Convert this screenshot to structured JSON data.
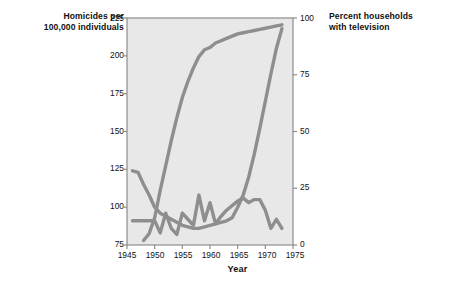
{
  "chart_data": {
    "type": "line",
    "title": "",
    "xlabel": "Year",
    "ylabel_left": "Homicides per\n100,000 individuals",
    "ylabel_right": "Percent households\nwith television",
    "xlim": [
      1945,
      1975
    ],
    "ylim_left": [
      75,
      225
    ],
    "ylim_right": [
      0,
      100
    ],
    "grid": false,
    "legend_position": "inline-annotations",
    "xticks": [
      "1945",
      "1950",
      "1955",
      "1960",
      "1965",
      "1970",
      "1975"
    ],
    "xtick_values": [
      1945,
      1950,
      1955,
      1960,
      1965,
      1970,
      1975
    ],
    "yticks_left": [
      "75",
      "100",
      "125",
      "150",
      "175",
      "200",
      "225"
    ],
    "ytick_left_values": [
      75,
      100,
      125,
      150,
      175,
      200,
      225
    ],
    "yticks_right": [
      "0",
      "25",
      "50",
      "75",
      "100"
    ],
    "ytick_right_values": [
      0,
      25,
      50,
      75,
      100
    ],
    "series": [
      {
        "name": "Television ownership, United States",
        "axis": "right",
        "label_text": "Television ownership,\nUnited States",
        "color": "#8e8e8e",
        "x": [
          1948,
          1949,
          1950,
          1951,
          1952,
          1953,
          1954,
          1955,
          1956,
          1957,
          1958,
          1959,
          1960,
          1961,
          1962,
          1963,
          1964,
          1965,
          1966,
          1967,
          1968,
          1969,
          1970,
          1971,
          1972,
          1973
        ],
        "values": [
          2,
          5,
          12,
          24,
          35,
          46,
          56,
          65,
          72,
          78,
          83,
          86,
          87,
          89,
          90,
          91,
          92,
          93,
          93.5,
          94,
          94.5,
          95,
          95.5,
          96,
          96.5,
          97
        ]
      },
      {
        "name": "Homicides, United States (whites)",
        "axis": "left",
        "label_text": "Homicides,\nUnited States\n(whites)",
        "color": "#8e8e8e",
        "x": [
          1946,
          1947,
          1948,
          1949,
          1950,
          1951,
          1952,
          1953,
          1954,
          1955,
          1956,
          1957,
          1958,
          1959,
          1960,
          1961,
          1962,
          1963,
          1964,
          1965,
          1966,
          1967,
          1968,
          1969,
          1970,
          1971,
          1972,
          1973
        ],
        "values": [
          124,
          123,
          115,
          108,
          100,
          96,
          94,
          92,
          90,
          88,
          87,
          86,
          86,
          87,
          88,
          89,
          90,
          91,
          93,
          100,
          108,
          120,
          135,
          152,
          170,
          188,
          205,
          218
        ]
      },
      {
        "name": "Homicides, South Africa (whites)",
        "axis": "left",
        "label_text": "Homicides,\nSouth Africa\n(whites)",
        "color": "#8e8e8e",
        "x": [
          1946,
          1947,
          1948,
          1949,
          1950,
          1951,
          1952,
          1953,
          1954,
          1955,
          1956,
          1957,
          1958,
          1959,
          1960,
          1961,
          1962,
          1963,
          1964,
          1965,
          1966,
          1967,
          1968,
          1969,
          1970,
          1971,
          1972,
          1973
        ],
        "values": [
          91,
          91,
          91,
          91,
          91,
          83,
          96,
          86,
          82,
          96,
          92,
          88,
          108,
          91,
          103,
          89,
          94,
          98,
          101,
          104,
          106,
          103,
          105,
          105,
          98,
          86,
          92,
          86
        ]
      }
    ],
    "colors": {
      "line": "#8e8e8e",
      "plot_background": "#e8e8e8",
      "plot_border": "#8c8c8c",
      "text": "#111111",
      "page_background": "#ffffff"
    }
  }
}
